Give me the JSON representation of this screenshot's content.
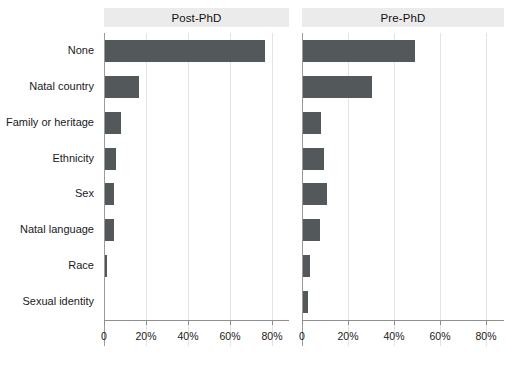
{
  "chart_data": {
    "type": "bar",
    "orientation": "horizontal",
    "title": "",
    "xlabel": "",
    "ylabel": "",
    "xlim": [
      0,
      0.88
    ],
    "xticks": [
      0,
      20,
      40,
      60,
      80
    ],
    "xtick_labels": [
      "0",
      "20%",
      "40%",
      "60%",
      "80%"
    ],
    "grid": true,
    "legend": false,
    "facet_by": "career stage",
    "categories": [
      "None",
      "Natal country",
      "Family or heritage",
      "Ethnicity",
      "Sex",
      "Natal language",
      "Race",
      "Sexual identity"
    ],
    "panels": [
      {
        "label": "Post-PhD",
        "values": [
          76,
          16,
          7.5,
          5,
          4.5,
          4.5,
          1,
          0
        ]
      },
      {
        "label": "Pre-PhD",
        "values": [
          49,
          30,
          8,
          9,
          10.5,
          7.5,
          3,
          2
        ]
      }
    ],
    "bar_color": "#53585a",
    "strip_background": "#ebebeb",
    "gridline_color": "#e3e3e3",
    "axis_color": "#8f8f8f",
    "background": "#ffffff"
  },
  "axis": {
    "tick_labels": [
      "0",
      "20%",
      "40%",
      "60%",
      "80%"
    ]
  }
}
